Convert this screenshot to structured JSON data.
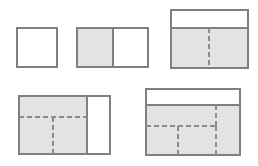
{
  "page": {
    "background_color": "#ffffff",
    "width": 258,
    "height": 166
  },
  "style": {
    "outline_color": "#808080",
    "outline_width": 1.4,
    "shaded_fill": "#e3e3e3",
    "unshaded_fill": "#ffffff",
    "dashed_color": "#8c8c8c",
    "dashed_width": 1.6,
    "dash_pattern": "5,3"
  },
  "figures": [
    {
      "id": "figure-1",
      "label": "single empty square",
      "x": 17,
      "y": 28,
      "width": 40,
      "height": 39,
      "shaded_fraction": "0",
      "regions": [
        {
          "name": "whole",
          "x": 17,
          "y": 28,
          "width": 40,
          "height": 39,
          "fill": "#ffffff"
        }
      ],
      "solid_lines": [],
      "dashed_lines": []
    },
    {
      "id": "figure-2",
      "label": "rectangle halved, left half shaded",
      "x": 77,
      "y": 28,
      "width": 71,
      "height": 39,
      "shaded_fraction": "1/2",
      "regions": [
        {
          "name": "left-half-shaded",
          "x": 77,
          "y": 28,
          "width": 36,
          "height": 39,
          "fill": "#e3e3e3"
        },
        {
          "name": "right-half-unshaded",
          "x": 113,
          "y": 28,
          "width": 35,
          "height": 39,
          "fill": "#ffffff"
        }
      ],
      "solid_lines": [
        {
          "name": "vertical-divider",
          "x1": 113,
          "y1": 28,
          "x2": 113,
          "y2": 67
        }
      ],
      "dashed_lines": []
    },
    {
      "id": "figure-3",
      "label": "rectangle with top white band and shaded lower band split by one dashed vertical",
      "x": 171,
      "y": 10,
      "width": 77,
      "height": 58,
      "shaded_fraction": "2/3",
      "regions": [
        {
          "name": "top-band-unshaded",
          "x": 171,
          "y": 10,
          "width": 77,
          "height": 18,
          "fill": "#ffffff"
        },
        {
          "name": "lower-band-shaded",
          "x": 171,
          "y": 28,
          "width": 77,
          "height": 40,
          "fill": "#e3e3e3"
        }
      ],
      "solid_lines": [
        {
          "name": "horizontal-band-divider",
          "x1": 171,
          "y1": 28,
          "x2": 248,
          "y2": 28
        }
      ],
      "dashed_lines": [
        {
          "name": "vertical-dashed-center",
          "x1": 209,
          "y1": 28,
          "x2": 209,
          "y2": 68
        }
      ]
    },
    {
      "id": "figure-4",
      "label": "rectangle shaded on left three quarters with horizontal dashed split and lower vertical dashed",
      "x": 19,
      "y": 96,
      "width": 91,
      "height": 58,
      "shaded_fraction": "3/4",
      "regions": [
        {
          "name": "left-shaded-block",
          "x": 19,
          "y": 96,
          "width": 68,
          "height": 58,
          "fill": "#e3e3e3"
        },
        {
          "name": "right-unshaded-column",
          "x": 87,
          "y": 96,
          "width": 23,
          "height": 58,
          "fill": "#ffffff"
        }
      ],
      "solid_lines": [
        {
          "name": "vertical-divider",
          "x1": 87,
          "y1": 96,
          "x2": 87,
          "y2": 154
        }
      ],
      "dashed_lines": [
        {
          "name": "horizontal-dashed",
          "x1": 19,
          "y1": 117,
          "x2": 87,
          "y2": 117
        },
        {
          "name": "vertical-dashed-lower",
          "x1": 53,
          "y1": 117,
          "x2": 53,
          "y2": 154
        }
      ]
    },
    {
      "id": "figure-5",
      "label": "rectangle with top white band, shaded body, one dashed horizontal and three dashed verticals",
      "x": 146,
      "y": 89,
      "width": 94,
      "height": 66,
      "shaded_fraction": "3/4",
      "regions": [
        {
          "name": "top-band-unshaded",
          "x": 146,
          "y": 89,
          "width": 94,
          "height": 16,
          "fill": "#ffffff"
        },
        {
          "name": "body-shaded",
          "x": 146,
          "y": 105,
          "width": 94,
          "height": 50,
          "fill": "#e3e3e3"
        }
      ],
      "solid_lines": [
        {
          "name": "horizontal-band-divider",
          "x1": 146,
          "y1": 105,
          "x2": 240,
          "y2": 105
        }
      ],
      "dashed_lines": [
        {
          "name": "vertical-dashed-right-upper",
          "x1": 216,
          "y1": 105,
          "x2": 216,
          "y2": 126
        },
        {
          "name": "horizontal-dashed",
          "x1": 146,
          "y1": 126,
          "x2": 216,
          "y2": 126
        },
        {
          "name": "vertical-dashed-middle-lower",
          "x1": 178,
          "y1": 126,
          "x2": 178,
          "y2": 155
        },
        {
          "name": "vertical-dashed-right-lower",
          "x1": 216,
          "y1": 126,
          "x2": 216,
          "y2": 155
        }
      ]
    }
  ]
}
